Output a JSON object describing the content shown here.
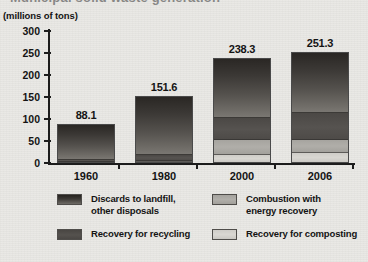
{
  "figure": {
    "title_partial": "Municipal solid waste generation",
    "axis_unit_label": "(millions of tons)"
  },
  "chart_data": {
    "type": "bar",
    "stacked": true,
    "title": "",
    "xlabel": "",
    "ylabel": "(millions of tons)",
    "ylim": [
      0,
      300
    ],
    "yticks": [
      0,
      50,
      100,
      150,
      200,
      250,
      300
    ],
    "grid": false,
    "legend_position": "bottom",
    "categories": [
      "1960",
      "1980",
      "2000",
      "2006"
    ],
    "totals": [
      88.1,
      151.6,
      238.3,
      251.3
    ],
    "total_labels": [
      "88.1",
      "151.6",
      "238.3",
      "251.3"
    ],
    "series": [
      {
        "name": "Recovery for composting",
        "key": "composting",
        "color": "#d4d2cd",
        "values": [
          0,
          0,
          16.5,
          20.6
        ]
      },
      {
        "name": "Combustion with energy recovery",
        "key": "combustion",
        "color": "#a9a7a2",
        "values": [
          0,
          2.7,
          33.7,
          31.4
        ]
      },
      {
        "name": "Recovery for recycling",
        "key": "recycling",
        "color": "#514e4b",
        "values": [
          5.6,
          14.5,
          52.7,
          61.9
        ]
      },
      {
        "name": "Discards to landfill, other disposals",
        "key": "discards",
        "color": "#3a3733",
        "values": [
          82.5,
          134.4,
          135.4,
          137.4
        ]
      }
    ]
  },
  "yaxis": {
    "ticks": [
      {
        "label": "300",
        "value": 300
      },
      {
        "label": "250",
        "value": 250
      },
      {
        "label": "200",
        "value": 200
      },
      {
        "label": "150",
        "value": 150
      },
      {
        "label": "100",
        "value": 100
      },
      {
        "label": "50",
        "value": 50
      },
      {
        "label": "0",
        "value": 0
      }
    ]
  },
  "xaxis": {
    "ticks": [
      {
        "label": "1960"
      },
      {
        "label": "1980"
      },
      {
        "label": "2000"
      },
      {
        "label": "2006"
      }
    ]
  },
  "legend": {
    "items": [
      {
        "key": "discards",
        "label": "Discards to landfill,\nother disposals"
      },
      {
        "key": "combustion",
        "label": "Combustion with\nenergy recovery"
      },
      {
        "key": "recycling",
        "label": "Recovery for recycling"
      },
      {
        "key": "composting",
        "label": "Recovery for composting"
      }
    ]
  }
}
